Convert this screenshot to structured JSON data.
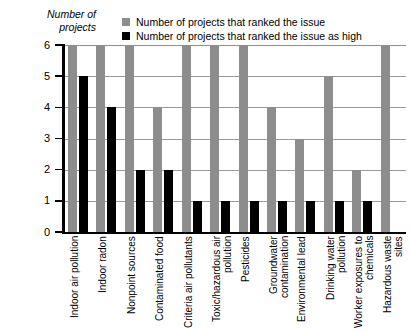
{
  "chart_data": {
    "type": "bar",
    "title": "",
    "ylabel": "Number of projects",
    "xlabel": "",
    "ylim": [
      0,
      6
    ],
    "yticks": [
      "0",
      "1",
      "2",
      "3",
      "4",
      "5",
      "6"
    ],
    "grid": true,
    "legend_position": "top",
    "categories": [
      "Indoor air pollution",
      "Indoor radon",
      "Nonpoint sources",
      "Contaminated food",
      "Criteria air pollutants",
      "Toxic/hazardous air pollution",
      "Pesticides",
      "Groundwater contamination",
      "Environmental lead",
      "Drinking water pollution",
      "Worker exposures to chemicals",
      "Hazardous waste sites"
    ],
    "series": [
      {
        "name": "Number of projects that ranked the issue",
        "color": "#8d8d8d",
        "values": [
          6,
          6,
          6,
          4,
          6,
          6,
          6,
          4,
          3,
          5,
          2,
          6
        ]
      },
      {
        "name": "Number of projects that ranked the issue as high",
        "color": "#000000",
        "values": [
          5,
          4,
          2,
          2,
          1,
          1,
          1,
          1,
          1,
          1,
          1,
          0
        ]
      }
    ]
  },
  "legend": {
    "items": [
      {
        "label": "Number of projects that ranked the issue",
        "swatch": "#8d8d8d"
      },
      {
        "label": "Number of projects that ranked the issue as high",
        "swatch": "#000000"
      }
    ]
  },
  "axis": {
    "y_title_line1": "Number of",
    "y_title_line2": "projects"
  }
}
